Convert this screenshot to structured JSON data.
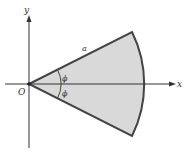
{
  "diagram": {
    "type": "circular-sector",
    "axes": {
      "x_label": "x",
      "y_label": "y",
      "origin_label": "O"
    },
    "sector": {
      "radius_label": "a",
      "half_angle_label_upper": "ϕ",
      "half_angle_label_lower": "ϕ",
      "fill_color": "#d9d9d9",
      "stroke_color": "#444444"
    },
    "colors": {
      "axis": "#333333",
      "background": "#ffffff"
    }
  }
}
